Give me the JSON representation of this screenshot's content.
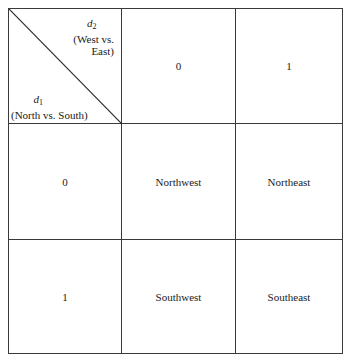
{
  "table": {
    "corner": {
      "column_variable": {
        "symbol": "d",
        "subscript": "2",
        "description_line1": "(West vs.",
        "description_line2": "East)"
      },
      "row_variable": {
        "symbol": "d",
        "subscript": "1",
        "description": "(North vs. South)"
      }
    },
    "column_headers": [
      "0",
      "1"
    ],
    "row_headers": [
      "0",
      "1"
    ],
    "cells": [
      [
        "Northwest",
        "Northeast"
      ],
      [
        "Southwest",
        "Southeast"
      ]
    ]
  }
}
